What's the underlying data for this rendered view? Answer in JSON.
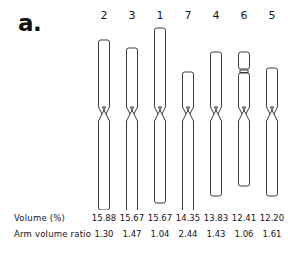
{
  "figure": {
    "panel_label": "a.",
    "type": "idiogram-karyotype"
  },
  "chromosomes": [
    {
      "label": "2",
      "volume_percent": "15.88",
      "arm_volume_ratio": "1.30",
      "short_arm_len": 74,
      "long_arm_len": 96,
      "width": 11,
      "satellite": false
    },
    {
      "label": "3",
      "volume_percent": "15.67",
      "arm_volume_ratio": "1.47",
      "short_arm_len": 66,
      "long_arm_len": 99,
      "width": 11,
      "satellite": false
    },
    {
      "label": "1",
      "volume_percent": "15.67",
      "arm_volume_ratio": "1.04",
      "short_arm_len": 86,
      "long_arm_len": 89,
      "width": 11,
      "satellite": false
    },
    {
      "label": "7",
      "volume_percent": "14.35",
      "arm_volume_ratio": "2.44",
      "short_arm_len": 42,
      "long_arm_len": 102,
      "width": 11,
      "satellite": false
    },
    {
      "label": "4",
      "volume_percent": "13.83",
      "arm_volume_ratio": "1.43",
      "short_arm_len": 62,
      "long_arm_len": 82,
      "width": 11,
      "satellite": false
    },
    {
      "label": "6",
      "volume_percent": "12.41",
      "arm_volume_ratio": "1.06",
      "short_arm_len": 62,
      "long_arm_len": 72,
      "width": 11,
      "satellite": true
    },
    {
      "label": "5",
      "volume_percent": "12.20",
      "arm_volume_ratio": "1.61",
      "short_arm_len": 46,
      "long_arm_len": 82,
      "width": 11,
      "satellite": false
    }
  ],
  "table": {
    "row_labels": [
      "Volume (%)",
      "Arm volume ratio"
    ],
    "volume_percent": [
      "15.88",
      "15.67",
      "15.67",
      "14.35",
      "13.83",
      "12.41",
      "12.20"
    ],
    "arm_volume_ratio": [
      "1.30",
      "1.47",
      "1.04",
      "2.44",
      "1.43",
      "1.06",
      "1.61"
    ]
  },
  "chart_data": {
    "type": "bar",
    "title": "a.",
    "xlabel": "",
    "ylabel": "",
    "categories": [
      "2",
      "3",
      "1",
      "7",
      "4",
      "6",
      "5"
    ],
    "series": [
      {
        "name": "Volume (%)",
        "values": [
          15.88,
          15.67,
          15.67,
          14.35,
          13.83,
          12.41,
          12.2
        ]
      },
      {
        "name": "Arm volume ratio",
        "values": [
          1.3,
          1.47,
          1.04,
          2.44,
          1.43,
          1.06,
          1.61
        ]
      }
    ],
    "annotations": [
      "Chromosome 6 carries a satellite and secondary constriction on its short arm"
    ],
    "grid": false,
    "legend": "none"
  },
  "style": {
    "stroke": "#3b3b3b",
    "fill": "#ffffff",
    "background": "#ffffff",
    "text": "#141414"
  }
}
